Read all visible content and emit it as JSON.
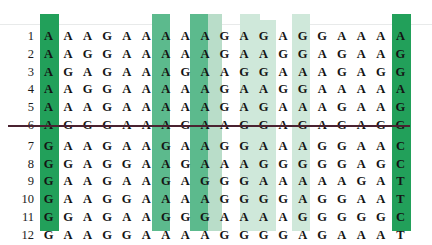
{
  "figure": {
    "row_count": 12,
    "column_count": 19,
    "divider_after_row": 6,
    "colors": {
      "highlight_dark": "#22a05a",
      "highlight_mid": "#5cba8d",
      "highlight_light": "#b9ddc9",
      "highlight_pale": "#cfe8da",
      "divider": "#4a2230",
      "text": "#141414",
      "background": "#ffffff"
    }
  },
  "row_labels": [
    "1",
    "2",
    "3",
    "4",
    "5",
    "6",
    "7",
    "8",
    "9",
    "10",
    "11",
    "12"
  ],
  "rows": [
    [
      "A",
      "A",
      "A",
      "G",
      "A",
      "A",
      "A",
      "A",
      "A",
      "G",
      "A",
      "G",
      "A",
      "G",
      "G",
      "A",
      "A",
      "A",
      "A"
    ],
    [
      "A",
      "A",
      "G",
      "G",
      "A",
      "A",
      "A",
      "A",
      "A",
      "G",
      "A",
      "A",
      "G",
      "G",
      "A",
      "G",
      "A",
      "A",
      "G"
    ],
    [
      "A",
      "G",
      "A",
      "G",
      "A",
      "A",
      "A",
      "G",
      "A",
      "A",
      "G",
      "G",
      "A",
      "A",
      "A",
      "G",
      "A",
      "G",
      "G"
    ],
    [
      "A",
      "A",
      "G",
      "G",
      "A",
      "A",
      "A",
      "A",
      "A",
      "G",
      "A",
      "A",
      "G",
      "G",
      "A",
      "A",
      "A",
      "A",
      "A"
    ],
    [
      "A",
      "A",
      "A",
      "G",
      "A",
      "A",
      "A",
      "A",
      "A",
      "G",
      "A",
      "G",
      "A",
      "A",
      "A",
      "G",
      "A",
      "A",
      "G"
    ],
    [
      "A",
      "G",
      "G",
      "G",
      "A",
      "A",
      "A",
      "G",
      "A",
      "A",
      "G",
      "G",
      "A",
      "G",
      "A",
      "G",
      "A",
      "G",
      "G"
    ],
    [
      "G",
      "A",
      "A",
      "G",
      "A",
      "A",
      "G",
      "A",
      "A",
      "G",
      "G",
      "A",
      "A",
      "A",
      "G",
      "G",
      "A",
      "A",
      "C"
    ],
    [
      "G",
      "G",
      "A",
      "G",
      "G",
      "A",
      "A",
      "G",
      "A",
      "A",
      "A",
      "G",
      "G",
      "G",
      "G",
      "G",
      "A",
      "G",
      "C"
    ],
    [
      "G",
      "A",
      "A",
      "G",
      "A",
      "A",
      "G",
      "A",
      "G",
      "G",
      "G",
      "A",
      "A",
      "A",
      "A",
      "A",
      "G",
      "A",
      "T"
    ],
    [
      "G",
      "A",
      "A",
      "G",
      "G",
      "A",
      "A",
      "A",
      "A",
      "G",
      "G",
      "G",
      "G",
      "A",
      "G",
      "G",
      "A",
      "A",
      "T"
    ],
    [
      "G",
      "G",
      "A",
      "G",
      "A",
      "A",
      "G",
      "G",
      "G",
      "A",
      "A",
      "A",
      "A",
      "G",
      "G",
      "G",
      "G",
      "G",
      "C"
    ],
    [
      "G",
      "A",
      "A",
      "G",
      "G",
      "A",
      "A",
      "A",
      "A",
      "G",
      "G",
      "G",
      "G",
      "A",
      "G",
      "A",
      "A",
      "A",
      "T"
    ]
  ],
  "highlighted_columns": {
    "dark": [
      1,
      19
    ],
    "mid": [
      5,
      7
    ],
    "light": [
      10,
      11,
      13,
      14
    ],
    "notch": [
      6,
      12
    ]
  }
}
